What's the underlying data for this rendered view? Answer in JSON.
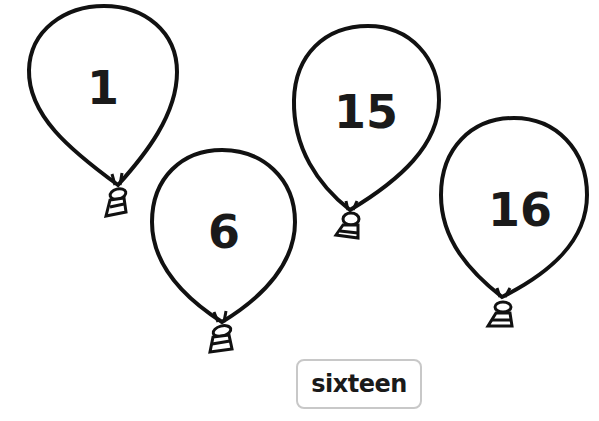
{
  "balloons": [
    {
      "number": "1",
      "color": "#ffffff",
      "outline": "#111111"
    },
    {
      "number": "6",
      "color": "#ffffff",
      "outline": "#111111"
    },
    {
      "number": "15",
      "color": "#ffffff",
      "outline": "#111111"
    },
    {
      "number": "16",
      "color": "#ffffff",
      "outline": "#111111"
    }
  ],
  "word_card": {
    "label": "sixteen",
    "border_color": "#c8c8c8"
  }
}
